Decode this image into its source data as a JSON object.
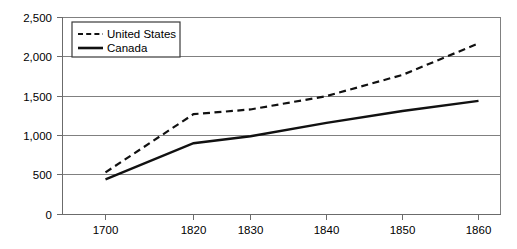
{
  "chart_data": {
    "type": "line",
    "title": "",
    "subtitle": "",
    "xlabel": "",
    "ylabel": "",
    "x": [
      1700,
      1820,
      1830,
      1840,
      1850,
      1860
    ],
    "xtick_labels": [
      "1700",
      "1820",
      "1830",
      "1840",
      "1850",
      "1860"
    ],
    "ytick_labels": [
      "0",
      "500",
      "1,000",
      "1,500",
      "2,000",
      "2,500"
    ],
    "ytick_values": [
      0,
      500,
      1000,
      1500,
      2000,
      2500
    ],
    "ylim": [
      0,
      2500
    ],
    "grid": "horizontal",
    "legend_position": "top-left",
    "series": [
      {
        "name": "United States",
        "style": "dashed",
        "color": "#111111",
        "values": [
          530,
          1270,
          1330,
          1500,
          1770,
          2170
        ]
      },
      {
        "name": "Canada",
        "style": "solid",
        "color": "#111111",
        "values": [
          440,
          900,
          990,
          1160,
          1310,
          1440
        ]
      }
    ]
  },
  "legend": {
    "entries": [
      {
        "label": "United States"
      },
      {
        "label": "Canada"
      }
    ]
  },
  "axes": {
    "y_tick_0": "0",
    "y_tick_1": "500",
    "y_tick_2": "1,000",
    "y_tick_3": "1,500",
    "y_tick_4": "2,000",
    "y_tick_5": "2,500",
    "x_tick_0": "1700",
    "x_tick_1": "1820",
    "x_tick_2": "1830",
    "x_tick_3": "1840",
    "x_tick_4": "1850",
    "x_tick_5": "1860"
  },
  "colors": {
    "series_line": "#111111",
    "gridline": "#808080",
    "axis": "#6b6b6b",
    "background": "#ffffff"
  }
}
